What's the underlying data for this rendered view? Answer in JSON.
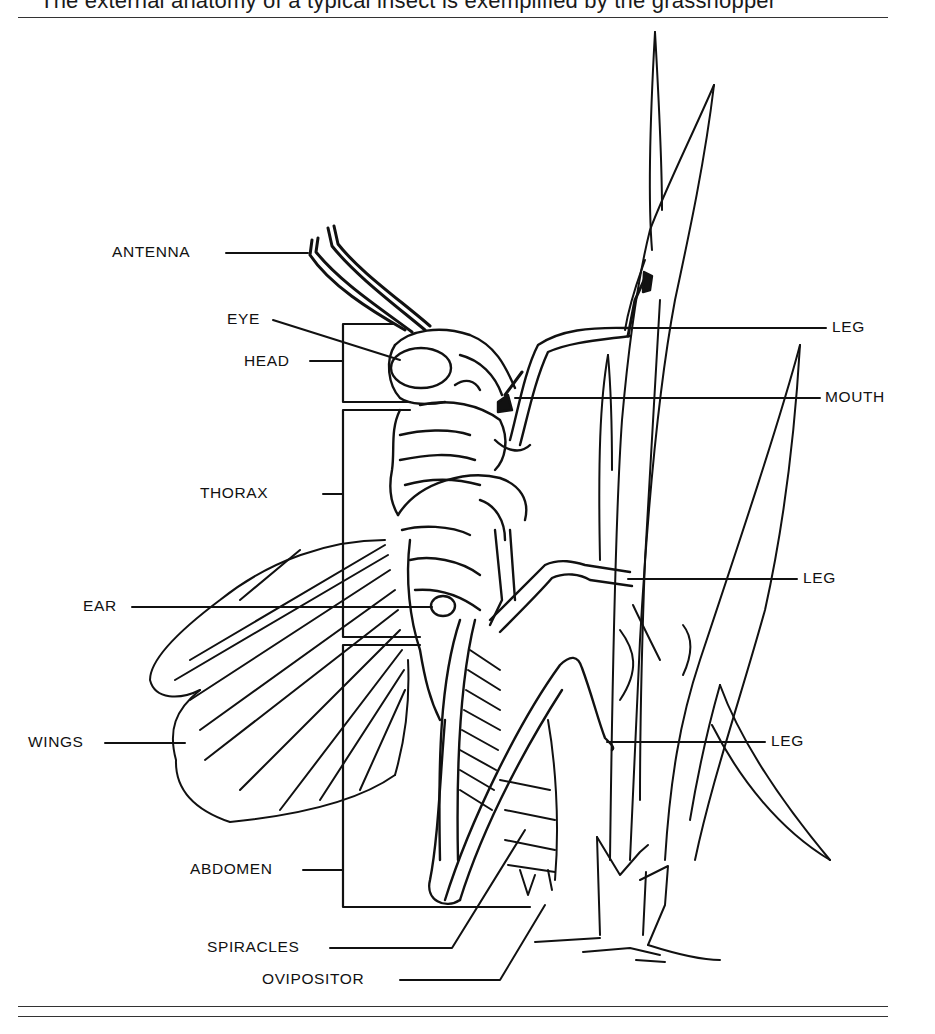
{
  "caption": "The external anatomy of a typical insect is exemplified by the grasshopper",
  "figure": {
    "labels": {
      "antenna": "ANTENNA",
      "eye": "EYE",
      "head": "HEAD",
      "thorax": "THORAX",
      "ear": "EAR",
      "wings": "WINGS",
      "abdomen": "ABDOMEN",
      "spiracles": "SPIRACLES",
      "ovipositor": "OVIPOSITOR",
      "leg_front": "LEG",
      "mouth": "MOUTH",
      "leg_middle": "LEG",
      "leg_hind": "LEG"
    }
  },
  "colors": {
    "ink": "#111111",
    "background": "#ffffff",
    "rule": "#333333"
  }
}
